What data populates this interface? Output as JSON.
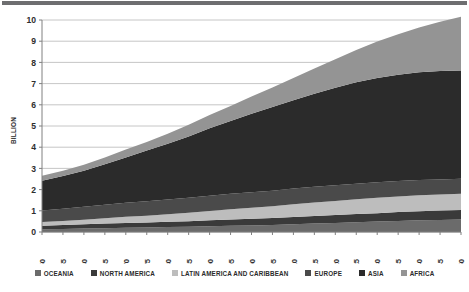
{
  "chart_data": {
    "type": "area",
    "title": "",
    "subtitle": "",
    "xlabel": "",
    "ylabel": "BILLION",
    "stacked": true,
    "grid": true,
    "legend_position": "bottom",
    "xlim": [
      1950,
      2050
    ],
    "ylim": [
      0,
      10
    ],
    "ytick_step": 1,
    "yticks": [
      "0",
      "1",
      "2",
      "3",
      "4",
      "5",
      "6",
      "7",
      "8",
      "9",
      "10"
    ],
    "categories": [
      1950,
      1955,
      1960,
      1965,
      1970,
      1975,
      1980,
      1985,
      1990,
      1995,
      2000,
      2005,
      2010,
      2015,
      2020,
      2025,
      2030,
      2035,
      2040,
      2045,
      2050
    ],
    "xtick_labels": [
      "1950",
      "1955",
      "1960",
      "1965",
      "1970",
      "1975",
      "1980",
      "1985",
      "1990",
      "1995",
      "2000",
      "2005",
      "2010",
      "2015",
      "2020",
      "2025",
      "2030",
      "2035",
      "2040",
      "2045",
      "2050"
    ],
    "series": [
      {
        "name": "OCEANIA",
        "color": "#6b6b6b",
        "values": [
          0.13,
          0.14,
          0.16,
          0.18,
          0.2,
          0.21,
          0.23,
          0.25,
          0.27,
          0.29,
          0.31,
          0.33,
          0.37,
          0.4,
          0.43,
          0.46,
          0.49,
          0.52,
          0.55,
          0.57,
          0.59
        ]
      },
      {
        "name": "NORTH AMERICA",
        "color": "#3a3a3a",
        "values": [
          0.17,
          0.19,
          0.2,
          0.22,
          0.23,
          0.24,
          0.25,
          0.26,
          0.28,
          0.3,
          0.31,
          0.33,
          0.34,
          0.36,
          0.37,
          0.39,
          0.4,
          0.42,
          0.43,
          0.44,
          0.45
        ]
      },
      {
        "name": "LATIN AMERICA AND CARIBBEAN",
        "color": "#bdbdbd",
        "values": [
          0.17,
          0.19,
          0.22,
          0.25,
          0.29,
          0.32,
          0.36,
          0.4,
          0.44,
          0.48,
          0.52,
          0.56,
          0.6,
          0.63,
          0.66,
          0.69,
          0.72,
          0.73,
          0.75,
          0.76,
          0.76
        ]
      },
      {
        "name": "EUROPE",
        "color": "#4a4a4a",
        "values": [
          0.55,
          0.58,
          0.61,
          0.64,
          0.66,
          0.68,
          0.69,
          0.71,
          0.72,
          0.73,
          0.73,
          0.73,
          0.74,
          0.74,
          0.75,
          0.74,
          0.74,
          0.73,
          0.72,
          0.71,
          0.71
        ]
      },
      {
        "name": "ASIA",
        "color": "#2b2b2b",
        "values": [
          1.4,
          1.54,
          1.7,
          1.9,
          2.14,
          2.39,
          2.63,
          2.89,
          3.18,
          3.43,
          3.71,
          3.95,
          4.17,
          4.39,
          4.6,
          4.78,
          4.92,
          5.02,
          5.08,
          5.11,
          5.11
        ]
      },
      {
        "name": "AFRICA",
        "color": "#949494",
        "values": [
          0.23,
          0.25,
          0.28,
          0.32,
          0.37,
          0.41,
          0.48,
          0.55,
          0.63,
          0.71,
          0.81,
          0.92,
          1.04,
          1.19,
          1.34,
          1.52,
          1.71,
          1.91,
          2.12,
          2.33,
          2.53
        ]
      }
    ],
    "totals": [
      2.65,
      2.89,
      3.17,
      3.51,
      3.89,
      4.25,
      4.64,
      5.06,
      5.52,
      5.94,
      6.39,
      6.82,
      7.26,
      7.71,
      8.15,
      8.58,
      8.98,
      9.33,
      9.65,
      9.92,
      10.15
    ],
    "grid_color": "#b7b7b7",
    "axis_color": "#808080",
    "background": "#ffffff"
  },
  "legend": {
    "items": [
      {
        "label": "OCEANIA",
        "color": "#6b6b6b"
      },
      {
        "label": "NORTH AMERICA",
        "color": "#3a3a3a"
      },
      {
        "label": "LATIN AMERICA AND CARIBBEAN",
        "color": "#bdbdbd"
      },
      {
        "label": "EUROPE",
        "color": "#4a4a4a"
      },
      {
        "label": "ASIA",
        "color": "#2b2b2b"
      },
      {
        "label": "AFRICA",
        "color": "#949494"
      }
    ]
  }
}
